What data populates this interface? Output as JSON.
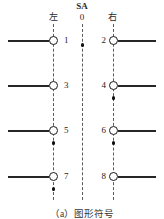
{
  "diagram": {
    "header": {
      "left_label": "左",
      "switch_label": "SA",
      "center_position": "0",
      "right_label": "右"
    },
    "caption": "（a）图形符号",
    "colors": {
      "line": "#262626",
      "dash": "#5a5a5a",
      "node_fill": "#ffffff",
      "dot": "#101010",
      "background": "#ffffff"
    },
    "rails": [
      {
        "name": "left-rail",
        "position": "左",
        "x": 53
      },
      {
        "name": "center-rail",
        "position": "0",
        "x": 82
      },
      {
        "name": "right-rail",
        "position": "右",
        "x": 113
      }
    ],
    "rows": [
      {
        "y": 40,
        "left_terminal": "1",
        "right_terminal": "2"
      },
      {
        "y": 85,
        "left_terminal": "3",
        "right_terminal": "4"
      },
      {
        "y": 130,
        "left_terminal": "5",
        "right_terminal": "6"
      },
      {
        "y": 176,
        "left_terminal": "7",
        "right_terminal": "8"
      }
    ],
    "contact_dots": [
      {
        "rail": "center-rail",
        "y": 45
      },
      {
        "rail": "right-rail",
        "y": 98
      },
      {
        "rail": "left-rail",
        "y": 143
      },
      {
        "rail": "right-rail",
        "y": 143
      },
      {
        "rail": "left-rail",
        "y": 189
      }
    ]
  }
}
